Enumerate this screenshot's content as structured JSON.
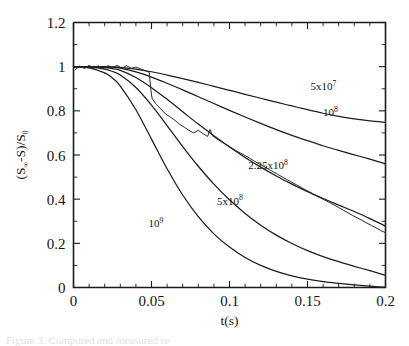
{
  "figure": {
    "kind": "scientific-line-plot",
    "background_color": "#ffffff",
    "ink_color": "#1d1d1d"
  },
  "axes": {
    "x_title": "t(s)",
    "y_title_parts": {
      "open": "(S",
      "infinity": "∞",
      "minus_s": "-S)/S",
      "zero": "0"
    },
    "y_title_plain": "(S∞-S)/S0",
    "x_tick_labels": [
      "0",
      "0.05",
      "0.1",
      "0.15",
      "0.2"
    ],
    "y_tick_labels": [
      "0",
      "0.2",
      "0.4",
      "0.6",
      "0.8",
      "1",
      "1.2"
    ]
  },
  "caption": {
    "ghost_text": "Figure 3.  Computed and measured re"
  },
  "chart_data": {
    "type": "line",
    "title": "",
    "xlabel": "t(s)",
    "ylabel": "(S∞-S)/S0",
    "xlim": [
      0,
      0.2
    ],
    "ylim": [
      0,
      1.2
    ],
    "x_major_ticks": [
      0,
      0.05,
      0.1,
      0.15,
      0.2
    ],
    "x_minor_ticks_per_interval": 5,
    "y_major_ticks": [
      0,
      0.2,
      0.4,
      0.6,
      0.8,
      1.0,
      1.2
    ],
    "y_minor_ticks_per_interval": 2,
    "grid": false,
    "legend": "inline-curve-labels",
    "annotations": [
      {
        "text_base": "5x10",
        "text_exp": "7",
        "label": "5x10^7",
        "x": 0.152,
        "y": 0.895
      },
      {
        "text_base": "10",
        "text_exp": "8",
        "label": "10^8",
        "x": 0.16,
        "y": 0.775
      },
      {
        "text_base": "2.25x10",
        "text_exp": "8",
        "label": "2.25x10^8",
        "x": 0.112,
        "y": 0.535
      },
      {
        "text_base": "5x10",
        "text_exp": "8",
        "label": "5x10^8",
        "x": 0.092,
        "y": 0.375
      },
      {
        "text_base": "10",
        "text_exp": "9",
        "label": "10^9",
        "x": 0.048,
        "y": 0.275
      }
    ],
    "series": [
      {
        "name": "5x10^7",
        "style": "smooth",
        "x": [
          0,
          0.01,
          0.02,
          0.025,
          0.03,
          0.04,
          0.05,
          0.06,
          0.07,
          0.08,
          0.09,
          0.1,
          0.11,
          0.12,
          0.13,
          0.14,
          0.15,
          0.16,
          0.17,
          0.18,
          0.19,
          0.2
        ],
        "y": [
          1.0,
          1.0,
          1.0,
          0.999,
          0.997,
          0.989,
          0.977,
          0.962,
          0.946,
          0.929,
          0.911,
          0.893,
          0.875,
          0.857,
          0.839,
          0.822,
          0.805,
          0.789,
          0.775,
          0.764,
          0.755,
          0.748
        ]
      },
      {
        "name": "10^8",
        "style": "smooth",
        "x": [
          0,
          0.01,
          0.02,
          0.025,
          0.03,
          0.04,
          0.05,
          0.06,
          0.07,
          0.08,
          0.09,
          0.1,
          0.11,
          0.12,
          0.13,
          0.14,
          0.15,
          0.16,
          0.17,
          0.18,
          0.19,
          0.2
        ],
        "y": [
          1.0,
          1.0,
          0.999,
          0.997,
          0.993,
          0.976,
          0.953,
          0.925,
          0.895,
          0.864,
          0.833,
          0.802,
          0.772,
          0.743,
          0.715,
          0.689,
          0.665,
          0.642,
          0.621,
          0.601,
          0.581,
          0.56
        ]
      },
      {
        "name": "2.25x10^8",
        "style": "smooth",
        "x": [
          0,
          0.01,
          0.02,
          0.025,
          0.03,
          0.04,
          0.05,
          0.06,
          0.07,
          0.08,
          0.09,
          0.1,
          0.11,
          0.12,
          0.13,
          0.14,
          0.15,
          0.16,
          0.17,
          0.18,
          0.19,
          0.2
        ],
        "y": [
          1.0,
          0.999,
          0.996,
          0.991,
          0.983,
          0.951,
          0.905,
          0.852,
          0.796,
          0.74,
          0.687,
          0.636,
          0.589,
          0.545,
          0.505,
          0.468,
          0.434,
          0.403,
          0.373,
          0.344,
          0.312,
          0.278
        ]
      },
      {
        "name": "5x10^8",
        "style": "smooth",
        "x": [
          0,
          0.01,
          0.02,
          0.025,
          0.03,
          0.04,
          0.05,
          0.06,
          0.07,
          0.08,
          0.09,
          0.1,
          0.11,
          0.12,
          0.13,
          0.14,
          0.15,
          0.16,
          0.17,
          0.18,
          0.19,
          0.2
        ],
        "y": [
          1.0,
          0.998,
          0.989,
          0.978,
          0.962,
          0.906,
          0.826,
          0.733,
          0.638,
          0.549,
          0.468,
          0.397,
          0.335,
          0.282,
          0.237,
          0.199,
          0.167,
          0.14,
          0.117,
          0.096,
          0.076,
          0.055
        ]
      },
      {
        "name": "10^9",
        "style": "smooth",
        "x": [
          0,
          0.01,
          0.02,
          0.025,
          0.03,
          0.04,
          0.05,
          0.06,
          0.07,
          0.08,
          0.09,
          0.1,
          0.11,
          0.12,
          0.13,
          0.14,
          0.15,
          0.16,
          0.17,
          0.18,
          0.19,
          0.2
        ],
        "y": [
          1.0,
          0.995,
          0.972,
          0.948,
          0.912,
          0.805,
          0.672,
          0.538,
          0.419,
          0.321,
          0.243,
          0.183,
          0.136,
          0.1,
          0.073,
          0.053,
          0.038,
          0.027,
          0.019,
          0.012,
          0.006,
          0.001
        ]
      },
      {
        "name": "measured",
        "style": "noisy",
        "x": [
          0.001,
          0.004,
          0.007,
          0.01,
          0.013,
          0.016,
          0.019,
          0.022,
          0.025,
          0.028,
          0.031,
          0.034,
          0.037,
          0.04,
          0.043,
          0.046,
          0.0485,
          0.049,
          0.0495,
          0.05,
          0.0505,
          0.053,
          0.056,
          0.059,
          0.062,
          0.065,
          0.068,
          0.071,
          0.074,
          0.077,
          0.08,
          0.083,
          0.086,
          0.0875,
          0.089,
          0.092,
          0.095,
          0.098,
          0.101,
          0.104,
          0.107,
          0.11,
          0.113,
          0.116,
          0.119,
          0.122,
          0.125,
          0.128,
          0.131,
          0.134,
          0.137,
          0.14,
          0.143,
          0.146,
          0.149,
          0.152,
          0.155,
          0.158,
          0.161,
          0.164,
          0.167,
          0.17,
          0.173,
          0.176,
          0.179,
          0.182,
          0.185,
          0.188,
          0.191,
          0.194,
          0.197,
          0.2
        ],
        "y": [
          0.985,
          1.003,
          0.992,
          1.006,
          0.993,
          1.004,
          0.99,
          1.005,
          0.995,
          1.006,
          0.992,
          1.004,
          0.993,
          0.998,
          0.99,
          0.982,
          0.975,
          0.94,
          0.902,
          0.872,
          0.855,
          0.83,
          0.808,
          0.786,
          0.772,
          0.757,
          0.739,
          0.726,
          0.712,
          0.7,
          0.712,
          0.697,
          0.684,
          0.716,
          0.688,
          0.672,
          0.659,
          0.647,
          0.634,
          0.621,
          0.609,
          0.597,
          0.585,
          0.572,
          0.56,
          0.548,
          0.536,
          0.524,
          0.512,
          0.5,
          0.488,
          0.476,
          0.465,
          0.453,
          0.441,
          0.43,
          0.418,
          0.407,
          0.396,
          0.385,
          0.374,
          0.362,
          0.35,
          0.338,
          0.326,
          0.315,
          0.304,
          0.292,
          0.281,
          0.27,
          0.258,
          0.248
        ],
        "noise_amplitude": 0.02,
        "note": "experimental trace tracking the 2.25x10^8 computed curve"
      }
    ]
  }
}
